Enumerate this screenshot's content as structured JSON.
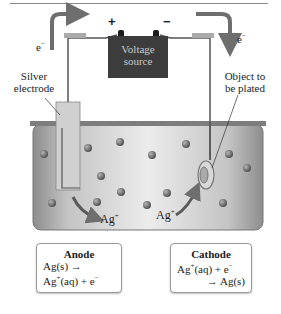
{
  "diagram": {
    "battery": {
      "line1": "Voltage",
      "line2": "source",
      "positive": "+",
      "negative": "−"
    },
    "electron_left": {
      "base": "e",
      "sup": "−"
    },
    "electron_right": {
      "base": "e",
      "sup": "−"
    },
    "labels": {
      "silver_electrode_1": "Silver",
      "silver_electrode_2": "electrode",
      "object_1": "Object to",
      "object_2": "be plated"
    },
    "ions": {
      "left": {
        "base": "Ag",
        "sup": "+"
      },
      "right": {
        "base": "Ag",
        "sup": "+"
      }
    },
    "anode": {
      "title": "Anode",
      "line1": "Ag(s)  →",
      "line2_base": "Ag",
      "line2_sup": "+",
      "line2_rest": "(aq) + e",
      "line2_sup2": "−"
    },
    "cathode": {
      "title": "Cathode",
      "line1_base": "Ag",
      "line1_sup": "+",
      "line1_rest": "(aq) + e",
      "line1_sup2": "−",
      "line2": "→  Ag(s)"
    },
    "colors": {
      "battery": "#3c3c3c",
      "arrow": "#6e6e6e",
      "solution": "#c8c8c8",
      "ion_particle": "#6a6a6a",
      "wire": "#555555"
    }
  }
}
